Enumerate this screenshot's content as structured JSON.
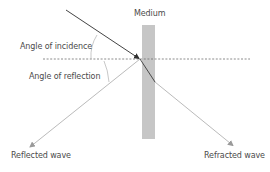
{
  "diagram": {
    "type": "wave-reflection-refraction",
    "labels": {
      "medium": "Medium",
      "angle_of_incidence": "Angle of incidence",
      "angle_of_reflection": "Angle of reflection",
      "reflected_wave": "Reflected wave",
      "refracted_wave": "Refracted wave"
    },
    "colors": {
      "incident_ray": "#2e2e2e",
      "reflected_ray": "#a8a8a8",
      "refracted_ray_outside": "#a8a8a8",
      "refracted_ray_inside": "#3a3a3a",
      "medium_fill": "#c6c6c6",
      "normal_line": "#6e6e6e",
      "angle_arc": "#b0b0b0",
      "text": "#4a4a4a"
    },
    "geometry": {
      "impact_point": [
        140,
        59
      ],
      "incident_start": [
        66,
        10
      ],
      "reflected_end": [
        29,
        148
      ],
      "refracted_exit": [
        155,
        82
      ],
      "refracted_end": [
        234,
        146
      ],
      "medium_rect": {
        "x": 142,
        "y": 25,
        "width": 13,
        "height": 114
      },
      "normal_line": {
        "x1": 43,
        "x2": 250,
        "y": 59
      }
    }
  }
}
